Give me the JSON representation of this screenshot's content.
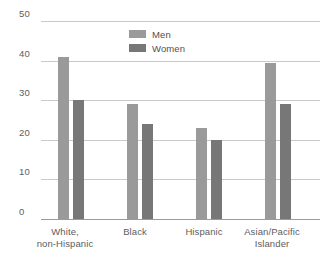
{
  "chart_data": {
    "type": "bar",
    "title": "",
    "subtitle": "",
    "xlabel": "",
    "ylabel": "",
    "ylim": [
      0,
      50
    ],
    "ytick_values": [
      50,
      40,
      30,
      20,
      10,
      0
    ],
    "ytick_labels": [
      "50",
      "40",
      "30",
      "20",
      "10",
      "0"
    ],
    "grid": true,
    "legend_position": "top-center",
    "categories": [
      "White, non-Hispanic",
      "Black",
      "Hispanic",
      "Asian/Pacific Islander"
    ],
    "category_lines": [
      [
        "White,",
        "non-Hispanic"
      ],
      [
        "Black"
      ],
      [
        "Hispanic"
      ],
      [
        "Asian/Pacific",
        "Islander"
      ]
    ],
    "series": [
      {
        "name": "Men",
        "color": "#9a9a9a",
        "values": [
          41,
          29,
          23,
          39.5
        ]
      },
      {
        "name": "Women",
        "color": "#777778",
        "values": [
          30,
          24,
          20,
          29
        ]
      }
    ]
  },
  "legend": {
    "items": [
      {
        "label": "Men"
      },
      {
        "label": "Women"
      }
    ]
  },
  "axis": {
    "y_labels": {
      "t50": "50",
      "t40": "40",
      "t30": "30",
      "t20": "20",
      "t10": "10",
      "t0": "0"
    }
  },
  "xaxis": {
    "cat0_line0": "White,",
    "cat0_line1": "non-Hispanic",
    "cat1_line0": "Black",
    "cat2_line0": "Hispanic",
    "cat3_line0": "Asian/Pacific",
    "cat3_line1": "Islander"
  },
  "colors": {
    "men_bar": "#9a9a9a",
    "women_bar": "#777778",
    "gridline": "#c9c9c9",
    "baseline": "#9b9b9b",
    "text": "#5d5d5f",
    "background": "#ffffff"
  }
}
